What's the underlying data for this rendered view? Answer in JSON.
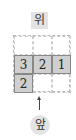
{
  "labels": {
    "top": "위",
    "front": "앞"
  },
  "grid": {
    "rows": [
      [
        "",
        "",
        ""
      ],
      [
        "3",
        "2",
        "1"
      ],
      [
        "2",
        "",
        ""
      ]
    ],
    "filled": [
      [
        false,
        false,
        false
      ],
      [
        true,
        true,
        true
      ],
      [
        true,
        false,
        false
      ]
    ]
  },
  "colors": {
    "filled": "#cfcfcf",
    "label_bg": "#e3e3e3"
  }
}
